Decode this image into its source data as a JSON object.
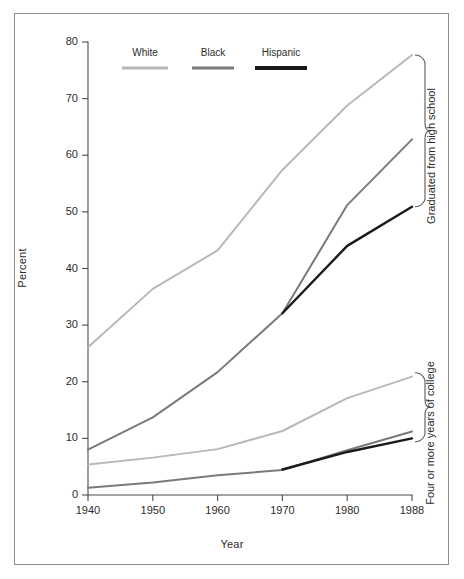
{
  "chart_data": {
    "type": "line",
    "title": "",
    "xlabel": "Year",
    "ylabel": "Percent",
    "xlim": [
      1940,
      1988
    ],
    "ylim": [
      0,
      80
    ],
    "yticks": [
      0,
      10,
      20,
      30,
      40,
      50,
      60,
      70,
      80
    ],
    "xticks": [
      1940,
      1950,
      1960,
      1970,
      1980,
      1988
    ],
    "x": [
      1940,
      1950,
      1960,
      1970,
      1980,
      1988
    ],
    "grid": false,
    "legend_position": "top-left-inside",
    "legend_entries": [
      "White",
      "Black",
      "Hispanic"
    ],
    "group_annotations": [
      "Graduated from high school",
      "Four or more years of college"
    ],
    "series": [
      {
        "name": "White",
        "group": "Graduated from high school",
        "color": "#b8b8b8",
        "x": [
          1940,
          1950,
          1960,
          1970,
          1980,
          1988
        ],
        "values": [
          26.1,
          36.4,
          43.2,
          57.4,
          68.8,
          77.7
        ]
      },
      {
        "name": "Black",
        "group": "Graduated from high school",
        "color": "#7a7a7a",
        "x": [
          1940,
          1950,
          1960,
          1970,
          1980,
          1988
        ],
        "values": [
          8.0,
          13.7,
          21.7,
          32.1,
          51.2,
          62.8
        ]
      },
      {
        "name": "Hispanic",
        "group": "Graduated from high school",
        "color": "#1a1a1a",
        "x": [
          1970,
          1980,
          1988
        ],
        "values": [
          32.1,
          44.0,
          50.9
        ]
      },
      {
        "name": "White",
        "group": "Four or more years of college",
        "color": "#b8b8b8",
        "x": [
          1940,
          1950,
          1960,
          1970,
          1980,
          1988
        ],
        "values": [
          5.4,
          6.6,
          8.1,
          11.3,
          17.1,
          20.9
        ]
      },
      {
        "name": "Black",
        "group": "Four or more years of college",
        "color": "#7a7a7a",
        "x": [
          1940,
          1950,
          1960,
          1970,
          1980,
          1988
        ],
        "values": [
          1.3,
          2.2,
          3.5,
          4.4,
          7.9,
          11.2
        ]
      },
      {
        "name": "Hispanic",
        "group": "Four or more years of college",
        "color": "#1a1a1a",
        "x": [
          1970,
          1980,
          1988
        ],
        "values": [
          4.5,
          7.6,
          10.0
        ]
      }
    ]
  },
  "axes": {
    "ylabel": "Percent",
    "xlabel": "Year",
    "ytick_labels": [
      "0",
      "10",
      "20",
      "30",
      "40",
      "50",
      "60",
      "70",
      "80"
    ],
    "xtick_labels": [
      "1940",
      "1950",
      "1960",
      "1970",
      "1980",
      "1988"
    ]
  },
  "legend": {
    "items": [
      {
        "label": "White",
        "color": "#b8b8b8"
      },
      {
        "label": "Black",
        "color": "#7a7a7a"
      },
      {
        "label": "Hispanic",
        "color": "#1a1a1a"
      }
    ]
  },
  "brackets": {
    "high_school": "Graduated from high school",
    "college": "Four or more years of college"
  },
  "colors": {
    "white_series": "#b8b8b8",
    "black_series": "#7a7a7a",
    "hispanic_series": "#1a1a1a",
    "axis": "#4a4a4a",
    "frame": "#8d8d8d",
    "background": "#ffffff",
    "text": "#2b2b2b"
  }
}
